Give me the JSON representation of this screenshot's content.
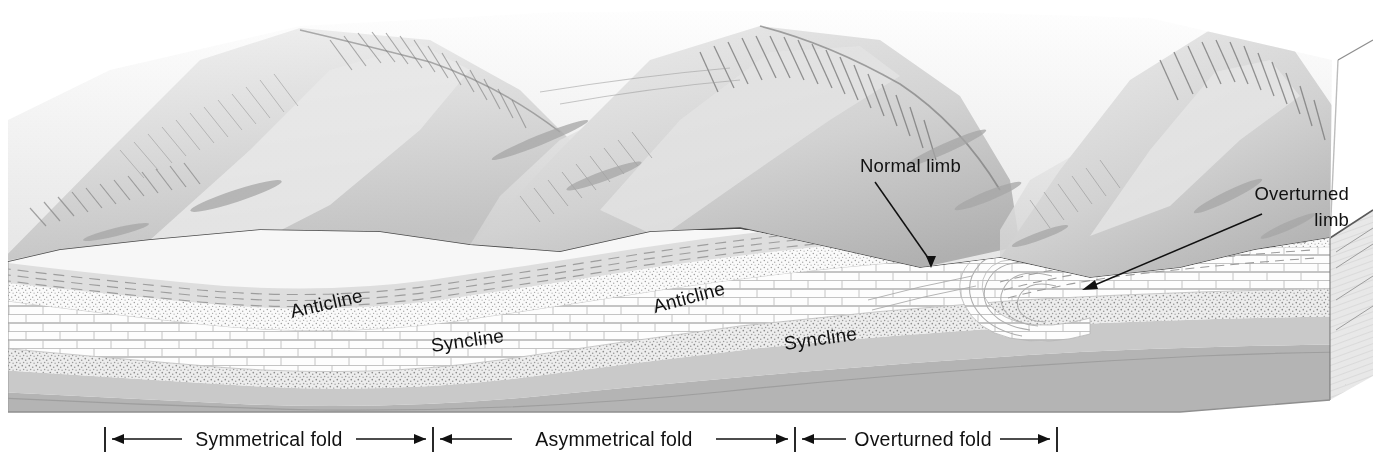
{
  "figure": {
    "type": "geologic block diagram",
    "background_color": "#ffffff",
    "ink_color": "#111111"
  },
  "structure_labels": [
    {
      "id": "anticline-1",
      "text": "Anticline",
      "x": 292,
      "y": 318,
      "rotate": -13
    },
    {
      "id": "syncline-1",
      "text": "Syncline",
      "x": 432,
      "y": 352,
      "rotate": -8
    },
    {
      "id": "anticline-2",
      "text": "Anticline",
      "x": 655,
      "y": 313,
      "rotate": -15
    },
    {
      "id": "syncline-2",
      "text": "Syncline",
      "x": 785,
      "y": 350,
      "rotate": -8
    }
  ],
  "callouts": [
    {
      "id": "normal-limb",
      "lines": [
        "Normal limb"
      ],
      "text_x": 860,
      "text_y": 172,
      "anchor": "start",
      "leader": {
        "x1": 875,
        "y1": 182,
        "x2": 931,
        "y2": 268
      }
    },
    {
      "id": "overturned-limb",
      "lines": [
        "Overturned",
        "limb"
      ],
      "text_x": 1349,
      "text_y": 200,
      "anchor": "end",
      "leader": {
        "x1": 1262,
        "y1": 214,
        "x2": 1082,
        "y2": 290
      }
    }
  ],
  "scale_bar": {
    "y": 438,
    "ticks": [
      105,
      433,
      795,
      1057
    ],
    "segments": [
      {
        "id": "symmetrical-fold",
        "label": "Symmetrical fold",
        "from": 105,
        "to": 433,
        "label_x": 269
      },
      {
        "id": "asymmetrical-fold",
        "label": "Asymmetrical fold",
        "from": 433,
        "to": 795,
        "label_x": 614
      },
      {
        "id": "overturned-fold",
        "label": "Overturned fold",
        "from": 795,
        "to": 1057,
        "label_x": 926
      }
    ]
  },
  "legend_units": [
    {
      "id": "shale",
      "name": "shale",
      "pattern": "dashed-lines",
      "color": "#b9b9b9"
    },
    {
      "id": "sandstone",
      "name": "sandstone",
      "pattern": "stipple",
      "color": "#d8d8d8"
    },
    {
      "id": "limestone",
      "name": "limestone",
      "pattern": "brick",
      "color": "#fbfbfb"
    },
    {
      "id": "basement",
      "name": "basement",
      "pattern": "solid-gray",
      "color": "#b4b4b4"
    }
  ]
}
